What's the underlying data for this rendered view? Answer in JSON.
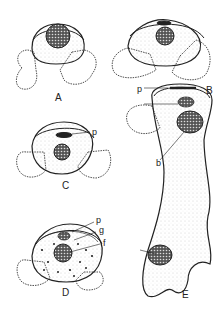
{
  "figure": {
    "type": "scientific-illustration",
    "panels": [
      {
        "id": "A",
        "label": "A",
        "description": "cell with dark reticulate nucleus at top, two lateral lobes"
      },
      {
        "id": "B",
        "label": "B",
        "description": "larger cell with nucleus centered, dark cap at top, two lateral lobes"
      },
      {
        "id": "C",
        "label": "C",
        "description": "cell with central nucleus and dark band labeled p",
        "annotations": [
          "p"
        ]
      },
      {
        "id": "D",
        "label": "D",
        "description": "cell with dotted cytoplasm, nucleus, labeled structures",
        "annotations": [
          "p",
          "g",
          "f"
        ]
      },
      {
        "id": "E",
        "label": "E",
        "description": "elongated branching cell with nuclei and labeled structures",
        "annotations": [
          "p",
          "b"
        ]
      }
    ],
    "annotation_labels": {
      "p": "p",
      "b": "b",
      "g": "g",
      "f": "f"
    }
  },
  "colors": {
    "ink": "#222222",
    "background": "#ffffff",
    "stipple": "#bbbbbb"
  }
}
